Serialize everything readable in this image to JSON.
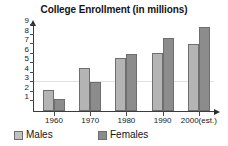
{
  "chart_data": {
    "type": "bar",
    "title": "College Enrollment (in millions)",
    "xlabel": "",
    "ylabel": "",
    "categories": [
      "1960",
      "1970",
      "1980",
      "1990",
      "2000(est.)"
    ],
    "series": [
      {
        "name": "Males",
        "color": "#b4b4b4",
        "values": [
          2.2,
          4.5,
          5.5,
          6.1,
          7.0
        ]
      },
      {
        "name": "Females",
        "color": "#8c8c8c",
        "values": [
          1.3,
          3.0,
          6.0,
          7.6,
          8.8
        ]
      }
    ],
    "ylim": [
      0,
      9
    ],
    "yticks": [
      1,
      2,
      3,
      4,
      5,
      6,
      7,
      8,
      9
    ],
    "ytick_labels": [
      "1",
      "2",
      "3",
      "4",
      "5",
      "6",
      "7",
      "8",
      "9"
    ],
    "grid": "faint-horizontal-at-3",
    "gridlines": [
      3
    ],
    "legend_position": "bottom",
    "legend": [
      "Males",
      "Females"
    ],
    "axis_arrows": true
  },
  "legend": {
    "males_label": "Males",
    "females_label": "Females"
  }
}
